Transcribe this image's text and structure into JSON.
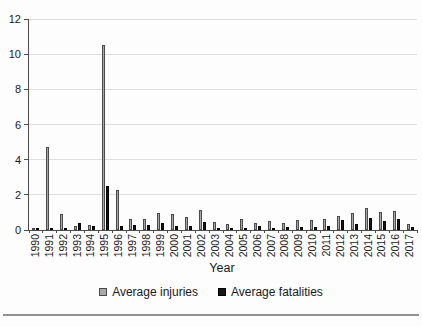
{
  "chart_data": {
    "type": "bar",
    "title": "",
    "xlabel": "Year",
    "ylabel": "",
    "ylim": [
      0,
      12
    ],
    "yticks": [
      0,
      2,
      4,
      6,
      8,
      10,
      12
    ],
    "grid": true,
    "legend_position": "bottom",
    "categories": [
      "1990",
      "1991",
      "1992",
      "1993",
      "1994",
      "1995",
      "1996",
      "1997",
      "1998",
      "1999",
      "2000",
      "2001",
      "2002",
      "2003",
      "2004",
      "2005",
      "2006",
      "2007",
      "2008",
      "2009",
      "2010",
      "2011",
      "2012",
      "2013",
      "2014",
      "2015",
      "2016",
      "2017"
    ],
    "series": [
      {
        "name": "Average injuries",
        "color": "#a8a8a8",
        "border": "#4a4a4a",
        "values": [
          0.05,
          4.7,
          0.9,
          0.25,
          0.3,
          10.5,
          2.3,
          0.6,
          0.65,
          0.95,
          0.9,
          0.75,
          1.15,
          0.45,
          0.35,
          0.6,
          0.4,
          0.5,
          0.4,
          0.55,
          0.55,
          0.6,
          0.8,
          0.95,
          1.25,
          1.05,
          1.1,
          0.35
        ]
      },
      {
        "name": "Average fatalities",
        "color": "#161616",
        "border": "#000000",
        "values": [
          0.02,
          0.1,
          0.1,
          0.4,
          0.25,
          2.5,
          0.25,
          0.3,
          0.3,
          0.4,
          0.2,
          0.2,
          0.45,
          0.05,
          0.1,
          0.1,
          0.25,
          0.1,
          0.15,
          0.15,
          0.15,
          0.2,
          0.55,
          0.35,
          0.7,
          0.5,
          0.65,
          0.15
        ]
      }
    ]
  },
  "style": {
    "gridline_color": "#dedede",
    "axis_color": "#4d4d4d",
    "text_color": "#1a1a1a",
    "bottom_rule_color": "#919191"
  }
}
